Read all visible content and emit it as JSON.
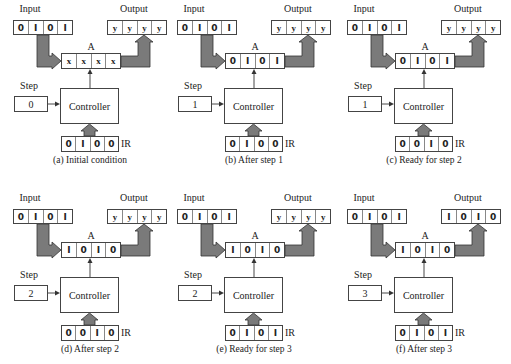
{
  "figure": {
    "labels": {
      "input": "Input",
      "output": "Output",
      "accumulator": "A",
      "step": "Step",
      "controller": "Controller",
      "ir": "IR"
    },
    "colors": {
      "arrow_fill": "#7a7a7a",
      "arrow_stroke": "#333333",
      "box_border": "#444444"
    },
    "panels": [
      {
        "caption": "(a) Initial condition",
        "input": [
          "0",
          "1",
          "0",
          "1"
        ],
        "output": [
          "y",
          "y",
          "y",
          "y"
        ],
        "a": [
          "x",
          "x",
          "x",
          "x"
        ],
        "step": "0",
        "ir": [
          "0",
          "1",
          "0",
          "0"
        ]
      },
      {
        "caption": "(b) After step 1",
        "input": [
          "0",
          "1",
          "0",
          "1"
        ],
        "output": [
          "y",
          "y",
          "y",
          "y"
        ],
        "a": [
          "0",
          "1",
          "0",
          "1"
        ],
        "step": "1",
        "ir": [
          "0",
          "1",
          "0",
          "0"
        ]
      },
      {
        "caption": "(c) Ready for step 2",
        "input": [
          "0",
          "1",
          "0",
          "1"
        ],
        "output": [
          "y",
          "y",
          "y",
          "y"
        ],
        "a": [
          "0",
          "1",
          "0",
          "1"
        ],
        "step": "1",
        "ir": [
          "0",
          "0",
          "1",
          "0"
        ]
      },
      {
        "caption": "(d) After step 2",
        "input": [
          "0",
          "1",
          "0",
          "1"
        ],
        "output": [
          "y",
          "y",
          "y",
          "y"
        ],
        "a": [
          "1",
          "0",
          "1",
          "0"
        ],
        "step": "2",
        "ir": [
          "0",
          "0",
          "1",
          "0"
        ]
      },
      {
        "caption": "(e) Ready for step 3",
        "input": [
          "0",
          "1",
          "0",
          "1"
        ],
        "output": [
          "y",
          "y",
          "y",
          "y"
        ],
        "a": [
          "1",
          "0",
          "1",
          "0"
        ],
        "step": "2",
        "ir": [
          "0",
          "1",
          "0",
          "1"
        ]
      },
      {
        "caption": "(f) After  step 3",
        "input": [
          "0",
          "1",
          "0",
          "1"
        ],
        "output": [
          "1",
          "0",
          "1",
          "0"
        ],
        "a": [
          "1",
          "0",
          "1",
          "0"
        ],
        "step": "3",
        "ir": [
          "0",
          "1",
          "0",
          "1"
        ]
      }
    ]
  }
}
